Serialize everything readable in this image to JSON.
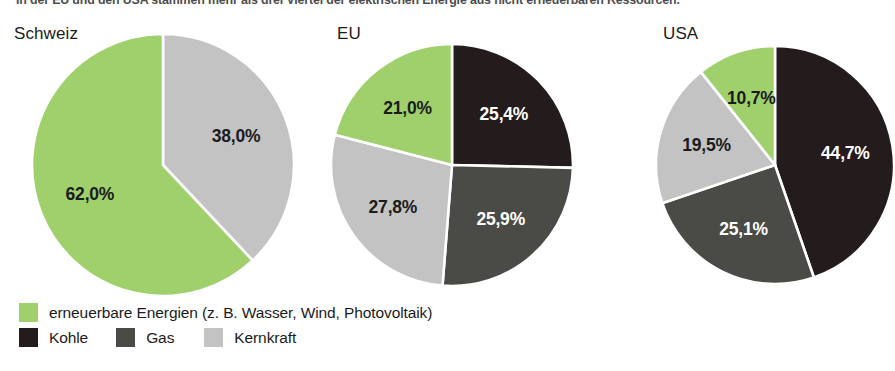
{
  "caption": "In der EU und den USA stammen mehr als drei Viertel der elektrischen Energie aus nicht erneuerbaren Ressourcen.",
  "colors": {
    "erneuerbar": "#9fd06c",
    "kohle": "#241b1d",
    "gas": "#4a4b46",
    "kernkraft": "#c3c3c3",
    "slice_border": "#ffffff",
    "text": "#1b1b1b",
    "label_on_dark": "#ffffff"
  },
  "legend": {
    "row1": [
      {
        "key": "erneuerbar",
        "label": "erneuerbare Energien (z. B. Wasser, Wind, Photovoltaik)",
        "color": "#9fd06c"
      }
    ],
    "row2": [
      {
        "key": "kohle",
        "label": "Kohle",
        "color": "#241b1d"
      },
      {
        "key": "gas",
        "label": "Gas",
        "color": "#4a4b46"
      },
      {
        "key": "kernkraft",
        "label": "Kernkraft",
        "color": "#c3c3c3"
      }
    ]
  },
  "chart_data": [
    {
      "type": "pie",
      "title": "Schweiz",
      "labels": [
        "Kernkraft",
        "erneuerbare Energien"
      ],
      "values": [
        38.0,
        25.0
      ],
      "value_labels": [
        "38,0%",
        "62,0%"
      ],
      "slices": [
        {
          "label": "Kernkraft",
          "value": 38.0,
          "value_label": "38,0%",
          "color": "#c3c3c3",
          "label_color": "#1b1b1b"
        },
        {
          "label": "erneuerbare Energien",
          "value": 62.0,
          "value_label": "62,0%",
          "color": "#9fd06c",
          "label_color": "#1b1b1b"
        }
      ],
      "start_angle_deg": 0,
      "direction": "clockwise",
      "center": {
        "x": 135,
        "y": 133
      },
      "radius": 131
    },
    {
      "type": "pie",
      "title": "EU",
      "labels": [
        "Kohle",
        "Gas",
        "Kernkraft",
        "erneuerbare Energien"
      ],
      "values": [
        25.4,
        25.9,
        27.8,
        21.0
      ],
      "value_labels": [
        "25,4%",
        "25,9%",
        "27,8%",
        "21,0%"
      ],
      "slices": [
        {
          "label": "Kohle",
          "value": 25.4,
          "value_label": "25,4%",
          "color": "#241b1d",
          "label_color": "#ffffff"
        },
        {
          "label": "Gas",
          "value": 25.9,
          "value_label": "25,9%",
          "color": "#4a4b46",
          "label_color": "#ffffff"
        },
        {
          "label": "Kernkraft",
          "value": 27.8,
          "value_label": "27,8%",
          "color": "#c3c3c3",
          "label_color": "#1b1b1b"
        },
        {
          "label": "erneuerbare Energien",
          "value": 21.0,
          "value_label": "21,0%",
          "color": "#9fd06c",
          "label_color": "#1b1b1b"
        }
      ],
      "start_angle_deg": 0,
      "direction": "clockwise",
      "center": {
        "x": 122,
        "y": 129
      },
      "radius": 121
    },
    {
      "type": "pie",
      "title": "USA",
      "labels": [
        "Kohle",
        "Gas",
        "Kernkraft",
        "erneuerbare Energien"
      ],
      "values": [
        44.7,
        25.1,
        19.5,
        10.7
      ],
      "value_labels": [
        "44,7%",
        "25,1%",
        "19,5%",
        "10,7%"
      ],
      "slices": [
        {
          "label": "Kohle",
          "value": 44.7,
          "value_label": "44,7%",
          "color": "#241b1d",
          "label_color": "#ffffff"
        },
        {
          "label": "Gas",
          "value": 25.1,
          "value_label": "25,1%",
          "color": "#4a4b46",
          "label_color": "#ffffff"
        },
        {
          "label": "Kernkraft",
          "value": 19.5,
          "value_label": "19,5%",
          "color": "#c3c3c3",
          "label_color": "#1b1b1b"
        },
        {
          "label": "erneuerbare Energien",
          "value": 10.7,
          "value_label": "10,7%",
          "color": "#9fd06c",
          "label_color": "#1b1b1b"
        }
      ],
      "start_angle_deg": 0,
      "direction": "clockwise",
      "center": {
        "x": 120,
        "y": 129
      },
      "radius": 119
    }
  ]
}
